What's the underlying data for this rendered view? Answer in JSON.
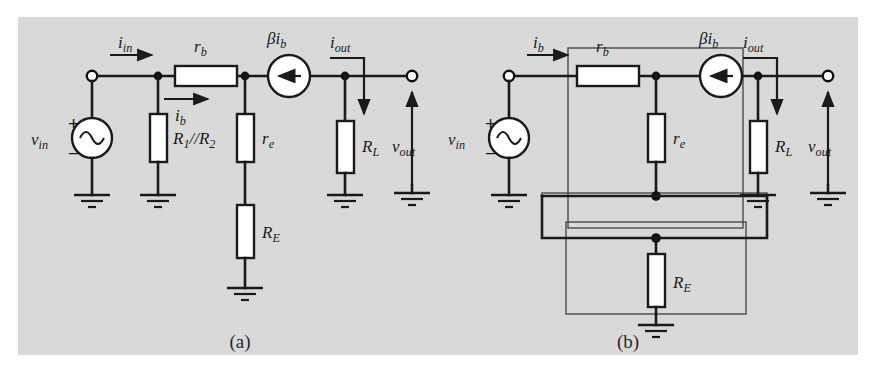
{
  "figure": {
    "background_color": "#d9d9d9",
    "page_color": "#ffffff",
    "line_color": "#1a1a1a",
    "panels": [
      {
        "key": "a",
        "caption": "(a)"
      },
      {
        "key": "b",
        "caption": "(b)"
      }
    ]
  },
  "panel_a": {
    "caption": "(a)",
    "labels": {
      "i_in": "i",
      "i_in_sub": "in",
      "r_b": "r",
      "r_b_sub": "b",
      "i_b": "i",
      "i_b_sub": "b",
      "beta": "β",
      "beta_i_b": "i",
      "beta_i_b_sub": "b",
      "i_out": "i",
      "i_out_sub": "out",
      "v_in": "v",
      "v_in_sub": "in",
      "v_out": "v",
      "v_out_sub": "out",
      "r1r2": "R",
      "r1r2_sub1": "1",
      "r1r2_mid": "//R",
      "r1r2_sub2": "2",
      "r_e": "r",
      "r_e_sub": "e",
      "R_E": "R",
      "R_E_sub": "E",
      "R_L": "R",
      "R_L_sub": "L",
      "plus": "+",
      "minus": "−"
    },
    "components": [
      {
        "name": "voltage-source-vin",
        "type": "ac-source",
        "label": "v_in"
      },
      {
        "name": "resistor-r1-parallel-r2",
        "type": "resistor",
        "label": "R1//R2"
      },
      {
        "name": "resistor-rb",
        "type": "resistor",
        "label": "r_b"
      },
      {
        "name": "resistor-re",
        "type": "resistor",
        "label": "r_e"
      },
      {
        "name": "resistor-RE",
        "type": "resistor",
        "label": "R_E"
      },
      {
        "name": "resistor-RL",
        "type": "resistor",
        "label": "R_L"
      },
      {
        "name": "current-source-beta-ib",
        "type": "dependent-current-source",
        "label": "βi_b",
        "direction": "left"
      }
    ],
    "ground_count": 5,
    "terminal_count": 2
  },
  "panel_b": {
    "caption": "(b)",
    "labels": {
      "i_b": "i",
      "i_b_sub": "b",
      "r_b": "r",
      "r_b_sub": "b",
      "beta": "β",
      "beta_i_b": "i",
      "beta_i_b_sub": "b",
      "i_out": "i",
      "i_out_sub": "out",
      "v_in": "v",
      "v_in_sub": "in",
      "v_out": "v",
      "v_out_sub": "out",
      "r_e": "r",
      "r_e_sub": "e",
      "R_E": "R",
      "R_E_sub": "E",
      "R_L": "R",
      "R_L_sub": "L",
      "plus": "+",
      "minus": "−"
    },
    "components": [
      {
        "name": "voltage-source-vin",
        "type": "ac-source",
        "label": "v_in"
      },
      {
        "name": "resistor-rb",
        "type": "resistor",
        "label": "r_b"
      },
      {
        "name": "resistor-re",
        "type": "resistor",
        "label": "r_e"
      },
      {
        "name": "resistor-RE",
        "type": "resistor",
        "label": "R_E"
      },
      {
        "name": "resistor-RL",
        "type": "resistor",
        "label": "R_L"
      },
      {
        "name": "current-source-beta-ib",
        "type": "dependent-current-source",
        "label": "βi_b",
        "direction": "left"
      }
    ],
    "enclosure_boxes": 3,
    "ground_count": 4,
    "terminal_count": 2
  }
}
